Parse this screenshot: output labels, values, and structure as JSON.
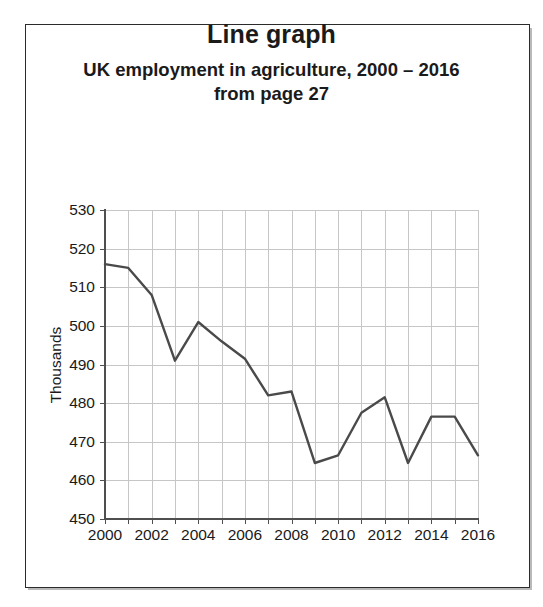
{
  "title": "Line graph",
  "subtitle_line1": "UK employment in agriculture, 2000 – 2016",
  "subtitle_line2": "from page 27",
  "axis": {
    "y_title": "Thousands",
    "y_ticks": [
      "530",
      "520",
      "510",
      "500",
      "490",
      "480",
      "470",
      "460",
      "450"
    ],
    "x_ticks": [
      "2000",
      "2002",
      "2004",
      "2006",
      "2008",
      "2010",
      "2012",
      "2014",
      "2016"
    ]
  },
  "colors": {
    "line": "#4a4a4a",
    "grid": "#c6c6c6",
    "axis": "#4f4f4f",
    "text": "#1a1a1a",
    "frame": "#2b2b2b",
    "background": "#ffffff"
  },
  "chart_data": {
    "type": "line",
    "title": "Line graph",
    "subtitle": "UK employment in agriculture, 2000 – 2016 from page 27",
    "xlabel": "",
    "ylabel": "Thousands",
    "xlim": [
      2000,
      2016
    ],
    "ylim": [
      450,
      530
    ],
    "ytick_step": 10,
    "xtick_step": 2,
    "x_gridline_step": 1,
    "grid": true,
    "legend": false,
    "x": [
      2000,
      2001,
      2002,
      2003,
      2004,
      2005,
      2006,
      2007,
      2008,
      2009,
      2010,
      2011,
      2012,
      2013,
      2014,
      2015,
      2016
    ],
    "series": [
      {
        "name": "UK employment in agriculture (thousands)",
        "color": "#4a4a4a",
        "values": [
          516,
          515,
          508,
          491,
          501,
          496,
          491.5,
          482,
          483,
          464.5,
          466.5,
          477.5,
          481.5,
          464.5,
          476.5,
          476.5,
          466.5
        ]
      }
    ]
  }
}
